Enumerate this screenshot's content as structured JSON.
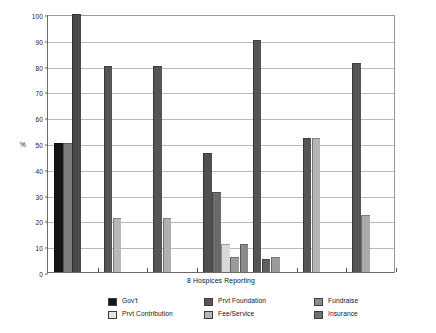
{
  "chart_data": {
    "type": "bar",
    "title": "",
    "subtitle": "",
    "xlabel": "8 Hospices Reporting",
    "ylabel": "%",
    "ylim": [
      0,
      100
    ],
    "yticks": [
      0,
      10,
      20,
      30,
      40,
      50,
      60,
      70,
      80,
      90,
      100
    ],
    "ytick_labels": [
      "0",
      "10",
      "20",
      "30",
      "40",
      "50",
      "60",
      "70",
      "80",
      "90",
      "100"
    ],
    "xtick_labels": [
      "",
      "",
      "",
      "",
      "",
      "",
      ""
    ],
    "grid": "horizontal",
    "legend_position": "bottom",
    "series": [
      {
        "name": "Gov't",
        "color": "#151515",
        "values": [
          50,
          null,
          null,
          null,
          null,
          null,
          null
        ]
      },
      {
        "name": "Prvt Contribution",
        "color": "#e2e2e2",
        "values": [
          null,
          null,
          null,
          11,
          null,
          null,
          null
        ]
      },
      {
        "name": "Prvt Foundation",
        "color": "#555555",
        "values": [
          50,
          80,
          80,
          46,
          90,
          52,
          81
        ]
      },
      {
        "name": "Fee/Service",
        "color": "#b8b8b8",
        "values": [
          null,
          21,
          21,
          31,
          5,
          52,
          22
        ]
      },
      {
        "name": "Fundraise",
        "color": "#8f8f8f",
        "values": [
          100,
          null,
          null,
          6,
          6,
          null,
          null
        ]
      },
      {
        "name": "Insurance",
        "color": "#6f6f6f",
        "values": [
          null,
          null,
          null,
          11,
          null,
          null,
          null
        ]
      }
    ],
    "groups": [
      {
        "index": 1,
        "bars": [
          {
            "series": "Gov't",
            "value": 50,
            "color": "#151515"
          },
          {
            "series": "Prvt Foundation",
            "value": 50,
            "color": "#7d7d7d"
          },
          {
            "series": "Fundraise",
            "value": 100,
            "color": "#4a4a4a"
          }
        ]
      },
      {
        "index": 2,
        "bars": [
          {
            "series": "Prvt Foundation",
            "value": 80,
            "color": "#555555"
          },
          {
            "series": "Fee/Service",
            "value": 21,
            "color": "#b8b8b8"
          }
        ]
      },
      {
        "index": 3,
        "bars": [
          {
            "series": "Prvt Foundation",
            "value": 80,
            "color": "#555555"
          },
          {
            "series": "Fee/Service",
            "value": 21,
            "color": "#b0b0b0"
          }
        ]
      },
      {
        "index": 4,
        "bars": [
          {
            "series": "Prvt Foundation",
            "value": 46,
            "color": "#4f4f4f"
          },
          {
            "series": "Fee/Service",
            "value": 31,
            "color": "#6a6a6a"
          },
          {
            "series": "Prvt Contribution",
            "value": 11,
            "color": "#d8d8d8"
          },
          {
            "series": "Fundraise",
            "value": 6,
            "color": "#9a9a9a"
          },
          {
            "series": "Insurance",
            "value": 11,
            "color": "#8a8a8a"
          }
        ]
      },
      {
        "index": 5,
        "bars": [
          {
            "series": "Prvt Foundation",
            "value": 90,
            "color": "#545454"
          },
          {
            "series": "Fee/Service",
            "value": 5,
            "color": "#5f5f5f"
          },
          {
            "series": "Fundraise",
            "value": 6,
            "color": "#9b9b9b"
          }
        ]
      },
      {
        "index": 6,
        "bars": [
          {
            "series": "Prvt Foundation",
            "value": 52,
            "color": "#555555"
          },
          {
            "series": "Fee/Service",
            "value": 52,
            "color": "#b4b4b4"
          }
        ]
      },
      {
        "index": 7,
        "bars": [
          {
            "series": "Prvt Foundation",
            "value": 81,
            "color": "#555555"
          },
          {
            "series": "Fee/Service",
            "value": 22,
            "color": "#ababab"
          }
        ]
      }
    ]
  },
  "legend": {
    "items": [
      {
        "label": "Gov't",
        "color": "#151515"
      },
      {
        "label": "Prvt Contribution",
        "color": "#e4e4e4"
      },
      {
        "label": "Prvt Foundation",
        "color": "#565656"
      },
      {
        "label": "Fee/Service",
        "color": "#b5b5b5"
      },
      {
        "label": "Fundraise",
        "color": "#8d8d8d"
      },
      {
        "label": "Insurance",
        "color": "#707070"
      }
    ]
  }
}
